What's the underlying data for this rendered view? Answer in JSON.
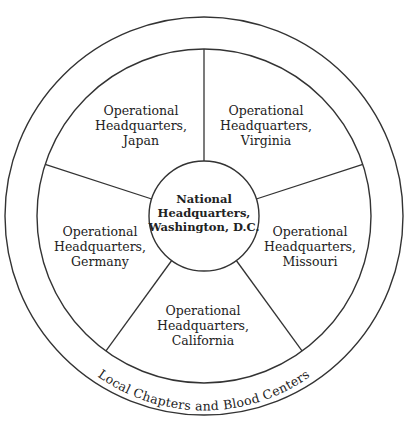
{
  "diagram": {
    "type": "hub-and-spoke organizational wheel",
    "center": {
      "lines": [
        "National",
        "Headquarters,",
        "Washington, D.C."
      ]
    },
    "segments": [
      {
        "id": "japan",
        "lines": [
          "Operational",
          "Headquarters,",
          "Japan"
        ]
      },
      {
        "id": "virginia",
        "lines": [
          "Operational",
          "Headquarters,",
          "Virginia"
        ]
      },
      {
        "id": "missouri",
        "lines": [
          "Operational",
          "Headquarters,",
          "Missouri"
        ]
      },
      {
        "id": "california",
        "lines": [
          "Operational",
          "Headquarters,",
          "California"
        ]
      },
      {
        "id": "germany",
        "lines": [
          "Operational",
          "Headquarters,",
          "Germany"
        ]
      }
    ],
    "outer_ring_label": "Local Chapters and Blood Centers",
    "colors": {
      "stroke": "#333333",
      "text": "#222222",
      "background": "#ffffff"
    }
  }
}
